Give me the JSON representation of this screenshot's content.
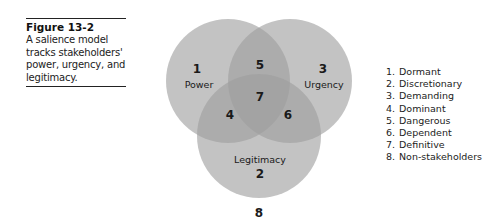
{
  "figure": {
    "label": "Figure 13-2",
    "caption": "A salience model tracks stakeholders' power, urgency, and legitimacy."
  },
  "diagram": {
    "type": "venn",
    "circles": [
      {
        "id": "power",
        "number": "1",
        "label": "Power",
        "cx": 228,
        "cy": 81,
        "r": 62
      },
      {
        "id": "urgency",
        "number": "3",
        "label": "Urgency",
        "cx": 290,
        "cy": 81,
        "r": 62
      },
      {
        "id": "legitimacy",
        "number": "2",
        "label": "Legitimacy",
        "cx": 259,
        "cy": 136,
        "r": 62
      }
    ],
    "regions": {
      "power_urgency": "5",
      "power_legitimacy": "4",
      "urgency_legitimacy": "6",
      "all_three": "7",
      "outside": "8"
    },
    "colors": {
      "circle_fill": "#a9a9a9",
      "circle_opacity": 0.65,
      "text": "#1a1a1a"
    }
  },
  "legend": {
    "items": [
      {
        "num": "1.",
        "label": "Dormant"
      },
      {
        "num": "2.",
        "label": "Discretionary"
      },
      {
        "num": "3.",
        "label": "Demanding"
      },
      {
        "num": "4.",
        "label": "Dominant"
      },
      {
        "num": "5.",
        "label": "Dangerous"
      },
      {
        "num": "6.",
        "label": "Dependent"
      },
      {
        "num": "7.",
        "label": "Definitive"
      },
      {
        "num": "8.",
        "label": "Non-stakeholders"
      }
    ]
  }
}
